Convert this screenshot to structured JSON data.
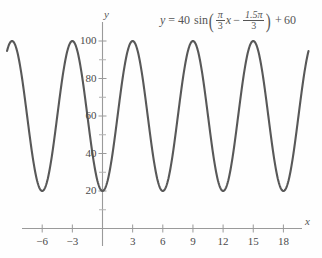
{
  "page": {
    "top_partial_text": "",
    "background_color": "#fefefe"
  },
  "equation": {
    "lhs": "y",
    "equals": "=",
    "amplitude": "40",
    "function": "sin",
    "open_paren": "(",
    "frac1_num": "π",
    "frac1_den": "3",
    "var": "x",
    "minus": "−",
    "frac2_num": "1.5π",
    "frac2_den": "3",
    "close_paren": ")",
    "plus": "+",
    "offset": "60",
    "plain": "y = 40 sin(π/3 x − 1.5π/3) + 60"
  },
  "axes": {
    "x_label": "x",
    "y_label": "y",
    "x_ticks": [
      "-6",
      "-3",
      "3",
      "6",
      "9",
      "12",
      "15",
      "18"
    ],
    "y_ticks": [
      "20",
      "40",
      "60",
      "80",
      "100"
    ],
    "axis_color": "#9a9a9a",
    "curve_color": "#585858"
  },
  "chart_data": {
    "type": "line",
    "title": "",
    "subtitle": "",
    "annotations": [
      "y = 40 sin(π/3 x − 1.5π/3) + 60"
    ],
    "xlabel": "x",
    "ylabel": "y",
    "xlim": [
      -9.5,
      20.5
    ],
    "ylim": [
      0,
      112
    ],
    "xticks": [
      -6,
      -3,
      3,
      6,
      9,
      12,
      15,
      18
    ],
    "yticks": [
      20,
      40,
      60,
      80,
      100
    ],
    "y_minor_ticks": [
      10,
      30,
      50,
      70,
      90
    ],
    "grid": false,
    "legend": null,
    "series": [
      {
        "name": "y = 40 sin(π/3 x − 1.5π/3) + 60",
        "color": "#585858",
        "amplitude": 40,
        "vertical_shift": 60,
        "period": 6,
        "phase_shift": 1.5,
        "minimum": 20,
        "maximum": 100,
        "maxima_x": [
          -9,
          -3,
          3,
          9,
          15
        ],
        "minima_x": [
          -6,
          0,
          6,
          12,
          18
        ],
        "x": [
          -9.5,
          -9,
          -8.5,
          -8,
          -7.5,
          -7,
          -6.5,
          -6,
          -5.5,
          -5,
          -4.5,
          -4,
          -3.5,
          -3,
          -2.5,
          -2,
          -1.5,
          -1,
          -0.5,
          0,
          0.5,
          1,
          1.5,
          2,
          2.5,
          3,
          3.5,
          4,
          4.5,
          5,
          5.5,
          6,
          6.5,
          7,
          7.5,
          8,
          8.5,
          9,
          9.5,
          10,
          10.5,
          11,
          11.5,
          12,
          12.5,
          13,
          13.5,
          14,
          14.5,
          15,
          15.5,
          16,
          16.5,
          17,
          17.5,
          18,
          18.5,
          19,
          19.5,
          20,
          20.5
        ],
        "y": [
          99.3,
          100,
          99.3,
          94.6,
          87.3,
          77.3,
          65.4,
          60,
          40,
          28.6,
          22.7,
          20,
          22.7,
          20,
          28.6,
          40,
          53.6,
          60,
          20.7,
          20,
          20.7,
          25.4,
          32.7,
          42.7,
          54.6,
          100,
          94.6,
          87.3,
          77.3,
          65.4,
          53.6,
          20,
          34.6,
          25.4,
          20.7,
          20,
          20.7,
          100,
          94.6,
          87.3,
          77.3,
          65.4,
          53.6,
          20,
          34.6,
          25.4,
          20.7,
          20,
          20.7,
          100,
          94.6,
          87.3,
          77.3,
          65.4,
          53.6,
          20,
          34.6,
          25.4,
          20.7,
          20,
          20.7
        ]
      }
    ]
  }
}
